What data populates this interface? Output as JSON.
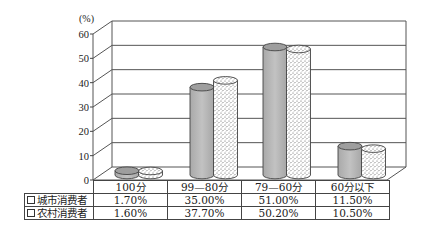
{
  "chart_data": {
    "type": "bar",
    "style": "3d-cylinder",
    "title": "",
    "unit_label": "(%)",
    "ylabel": "(%)",
    "xlabel": "",
    "ylim": [
      0,
      60
    ],
    "yticks": [
      "0",
      "10",
      "20",
      "30",
      "40",
      "50",
      "60"
    ],
    "grid": true,
    "categories": [
      "100分",
      "99—80分",
      "79—60分",
      "60分以下"
    ],
    "series": [
      {
        "name": "城市消费者",
        "values": [
          1.7,
          35.0,
          51.0,
          11.5
        ],
        "labels": [
          "1.70%",
          "35.00%",
          "51.00%",
          "11.50%"
        ],
        "color": "#b8b8b8",
        "fill": "solid-gray"
      },
      {
        "name": "农村消费者",
        "values": [
          1.6,
          37.7,
          50.2,
          10.5
        ],
        "labels": [
          "1.60%",
          "37.70%",
          "50.20%",
          "10.50%"
        ],
        "color": "#ffffff",
        "fill": "stippled"
      }
    ],
    "legend_position": "data-table-below"
  },
  "table": {
    "header": [
      "100分",
      "99—80分",
      "79—60分",
      "60分以下"
    ],
    "rows": [
      {
        "label": "城市消费者",
        "cells": [
          "1.70%",
          "35.00%",
          "51.00%",
          "11.50%"
        ]
      },
      {
        "label": "农村消费者",
        "cells": [
          "1.60%",
          "37.70%",
          "50.20%",
          "10.50%"
        ]
      }
    ]
  }
}
